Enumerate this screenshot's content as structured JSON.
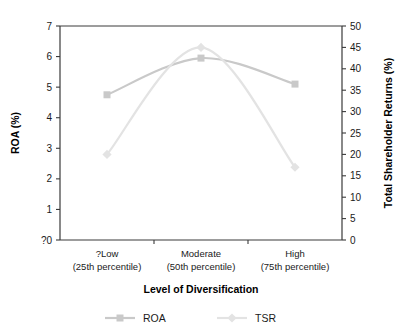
{
  "chart_data": {
    "type": "line",
    "title": "",
    "xlabel": "Level of Diversification",
    "categories": [
      "?Low",
      "Moderate",
      "High"
    ],
    "category_sublabels": [
      "(25th percentile)",
      "(50th percentile)",
      "(75th percentile)"
    ],
    "grid": false,
    "legend_position": "bottom",
    "series": [
      {
        "name": "ROA",
        "axis": "left",
        "marker": "square",
        "color": "#c9c9c9",
        "values": [
          4.75,
          5.95,
          5.1
        ]
      },
      {
        "name": "TSR",
        "axis": "right",
        "marker": "diamond",
        "color": "#e3e3e3",
        "values": [
          20,
          45,
          17
        ]
      }
    ],
    "left_axis": {
      "label": "ROA (%)",
      "ylim": [
        0,
        7
      ],
      "tick_step": 1,
      "ticks": [
        "?0",
        "1",
        "2",
        "3",
        "4",
        "5",
        "6",
        "7"
      ],
      "tick_values": [
        0,
        1,
        2,
        3,
        4,
        5,
        6,
        7
      ]
    },
    "right_axis": {
      "label": "Total Shareholder Returns (%)",
      "ylim": [
        0,
        50
      ],
      "tick_step": 5,
      "ticks": [
        "0",
        "5",
        "10",
        "15",
        "20",
        "25",
        "30",
        "35",
        "40",
        "45",
        "50"
      ],
      "tick_values": [
        0,
        5,
        10,
        15,
        20,
        25,
        30,
        35,
        40,
        45,
        50
      ]
    },
    "legend": [
      {
        "label": "ROA",
        "color": "#c9c9c9",
        "marker": "square"
      },
      {
        "label": "TSR",
        "color": "#e3e3e3",
        "marker": "diamond"
      }
    ]
  },
  "colors": {
    "axis": "#3a3a3a",
    "text": "#1a1a1a",
    "roa": "#c9c9c9",
    "tsr": "#e3e3e3",
    "background": "#ffffff"
  }
}
